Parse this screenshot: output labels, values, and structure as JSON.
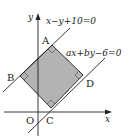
{
  "figure": {
    "type": "coordinate-geometry diagram",
    "axes": {
      "x_label": "x",
      "y_label": "y",
      "origin_label": "O"
    },
    "lines": [
      {
        "id": "line1",
        "equation": "x−y+10=0"
      },
      {
        "id": "line2",
        "equation": "ax+by−6=0"
      }
    ],
    "vertices": [
      {
        "label": "A"
      },
      {
        "label": "B"
      },
      {
        "label": "C"
      },
      {
        "label": "D"
      }
    ],
    "square_fill_color": "#b3b3b3",
    "stroke_color": "#222222"
  }
}
